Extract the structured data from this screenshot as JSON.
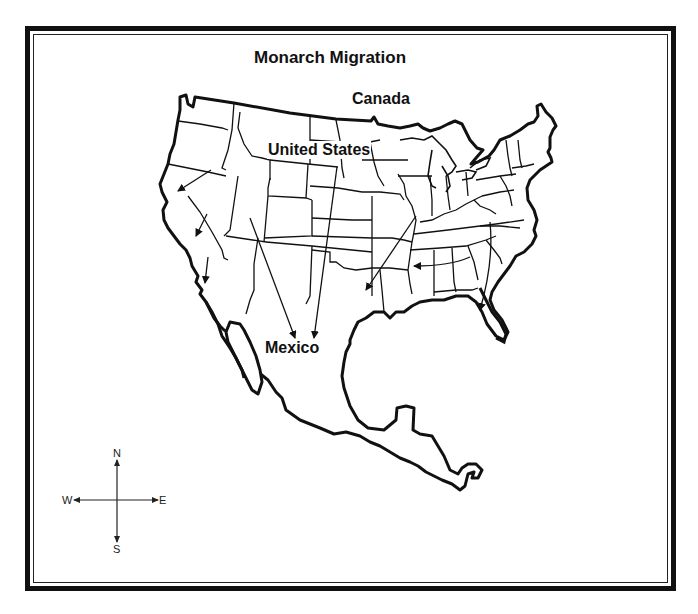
{
  "map": {
    "title": "Monarch Migration",
    "regions": {
      "canada": "Canada",
      "united_states": "United States",
      "mexico": "Mexico"
    },
    "compass": {
      "north": "N",
      "south": "S",
      "west": "W",
      "east": "E"
    },
    "migration_arrows": [
      {
        "from": "Oregon",
        "to": "Northern California",
        "direction": "southwest"
      },
      {
        "from": "Nevada",
        "to": "Central California",
        "direction": "southwest"
      },
      {
        "from": "Southern California",
        "to": "Baja California",
        "direction": "south"
      },
      {
        "from": "Utah",
        "to": "Central Mexico",
        "direction": "south-southeast"
      },
      {
        "from": "Nebraska/South Dakota",
        "to": "Central Mexico",
        "direction": "south"
      },
      {
        "from": "Illinois",
        "to": "Texas",
        "direction": "southwest"
      },
      {
        "from": "Virginia/Carolinas",
        "to": "Mississippi",
        "direction": "west"
      },
      {
        "from": "Virginia",
        "to": "Florida",
        "direction": "south"
      }
    ],
    "colors": {
      "ink": "#111111",
      "background": "#ffffff"
    }
  }
}
